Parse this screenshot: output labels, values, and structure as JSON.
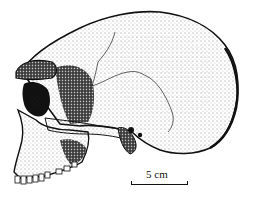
{
  "figure": {
    "style": "stipple illustration",
    "facing": "left"
  },
  "scale_bar": {
    "label": "5 cm"
  },
  "colors": {
    "ink": "#111111",
    "background": "#ffffff"
  }
}
